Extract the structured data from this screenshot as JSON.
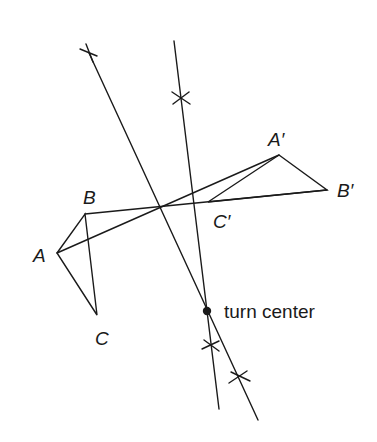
{
  "diagram": {
    "type": "rotation-construction",
    "labels": {
      "A": "A",
      "B": "B",
      "C": "C",
      "A_prime": "A′",
      "B_prime": "B′",
      "C_prime": "C′",
      "turn_center": "turn center"
    },
    "points": {
      "A": [
        57,
        253
      ],
      "B": [
        85,
        214
      ],
      "C": [
        97,
        315
      ],
      "A_prime": [
        279,
        155
      ],
      "B_prime": [
        327,
        190
      ],
      "C_prime": [
        208,
        202
      ],
      "turn_center": [
        207,
        311
      ]
    },
    "colors": {
      "stroke": "#1a1a1a",
      "background": "#ffffff"
    }
  }
}
